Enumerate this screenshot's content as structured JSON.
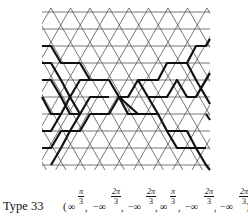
{
  "figure": {
    "grid": {
      "row_y": [
        12,
        29,
        46,
        63,
        80,
        97,
        114,
        131,
        148,
        165
      ],
      "left": 42,
      "right": 210,
      "side": 19.5,
      "first_vertex_x_even_row": 51,
      "line_color": "#555555",
      "bold_color": "#111111"
    },
    "bold_paths": [
      [
        [
          42,
          46
        ],
        [
          51,
          46
        ],
        [
          61,
          63
        ],
        [
          80,
          63
        ],
        [
          90,
          80
        ],
        [
          109,
          80
        ],
        [
          119,
          97
        ],
        [
          128,
          97
        ],
        [
          138,
          80
        ],
        [
          158,
          80
        ],
        [
          167,
          63
        ],
        [
          187,
          63
        ],
        [
          196,
          46
        ],
        [
          206,
          46
        ],
        [
          210,
          39
        ]
      ],
      [
        [
          42,
          63
        ],
        [
          51,
          63
        ],
        [
          61,
          80
        ],
        [
          70,
          97
        ],
        [
          80,
          114
        ],
        [
          70,
          131
        ],
        [
          61,
          148
        ],
        [
          51,
          165
        ]
      ],
      [
        [
          42,
          148
        ],
        [
          51,
          148
        ],
        [
          61,
          131
        ],
        [
          70,
          131
        ],
        [
          80,
          131
        ],
        [
          90,
          114
        ],
        [
          109,
          114
        ],
        [
          119,
          97
        ],
        [
          138,
          114
        ],
        [
          158,
          114
        ],
        [
          167,
          131
        ],
        [
          177,
          148
        ],
        [
          196,
          148
        ],
        [
          206,
          148
        ]
      ],
      [
        [
          42,
          80
        ],
        [
          51,
          80
        ],
        [
          61,
          97
        ],
        [
          70,
          114
        ],
        [
          80,
          114
        ],
        [
          90,
          97
        ],
        [
          109,
          97
        ]
      ],
      [
        [
          42,
          97
        ],
        [
          51,
          114
        ],
        [
          61,
          114
        ],
        [
          70,
          97
        ],
        [
          80,
          80
        ],
        [
          90,
          80
        ]
      ],
      [
        [
          119,
          97
        ],
        [
          128,
          114
        ],
        [
          138,
          114
        ]
      ],
      [
        [
          138,
          80
        ],
        [
          148,
          97
        ],
        [
          158,
          114
        ]
      ],
      [
        [
          148,
          97
        ],
        [
          167,
          97
        ],
        [
          177,
          80
        ],
        [
          187,
          97
        ],
        [
          196,
          97
        ],
        [
          206,
          80
        ],
        [
          210,
          73
        ]
      ],
      [
        [
          187,
          63
        ],
        [
          196,
          80
        ],
        [
          206,
          97
        ],
        [
          210,
          104
        ]
      ],
      [
        [
          167,
          131
        ],
        [
          187,
          131
        ],
        [
          196,
          148
        ],
        [
          206,
          165
        ],
        [
          210,
          170
        ]
      ],
      [
        [
          42,
          131
        ],
        [
          51,
          131
        ],
        [
          61,
          114
        ]
      ],
      [
        [
          206,
          114
        ],
        [
          210,
          120
        ]
      ]
    ]
  },
  "caption": {
    "type_label": "Type 33",
    "open_paren": "(",
    "close_paren": ")",
    "terms": [
      {
        "sign": "",
        "base": "∞",
        "num": "π",
        "den": "3"
      },
      {
        "sign": "−",
        "base": "∞",
        "num": "2π",
        "den": "3"
      },
      {
        "sign": "−",
        "base": "∞",
        "num": "2π",
        "den": "3"
      },
      {
        "sign": "",
        "base": "∞",
        "num": "π",
        "den": "3"
      },
      {
        "sign": "−",
        "base": "∞",
        "num": "2π",
        "den": "3"
      },
      {
        "sign": "−",
        "base": "∞",
        "num": "2π",
        "den": "3"
      }
    ],
    "comma": ","
  }
}
